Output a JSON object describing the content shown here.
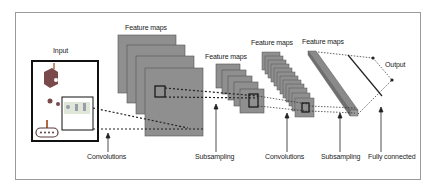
{
  "diagram": {
    "labels": {
      "input": "Input",
      "feature_maps_1": "Feature maps",
      "feature_maps_2": "Feature maps",
      "feature_maps_3": "Feature maps",
      "feature_maps_4": "Feature maps",
      "output": "Output"
    },
    "stages": [
      {
        "label": "Convolutions"
      },
      {
        "label": "Subsampling"
      },
      {
        "label": "Convolutions"
      },
      {
        "label": "Subsampling"
      },
      {
        "label": "Fully connected"
      }
    ],
    "colors": {
      "map_fill": "#8f8f8f",
      "map_stroke": "#555555",
      "line": "#222222",
      "frame": "#9a9a9a"
    }
  }
}
